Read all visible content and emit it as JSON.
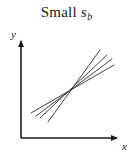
{
  "figure": {
    "title_main": "Small",
    "title_symbol": "s",
    "title_subscript": "b",
    "background_color": "#ffffff",
    "ink_color": "#1a1a1a",
    "line_color": "#2b2b2b",
    "width": 133,
    "height": 154
  },
  "axes": {
    "x_label": "x",
    "y_label": "y",
    "origin": {
      "x": 21,
      "y": 138
    },
    "x_end": {
      "x": 120,
      "y": 138
    },
    "y_end": {
      "x": 21,
      "y": 38
    },
    "arrowheads": true
  },
  "chart_data": {
    "type": "line",
    "xlabel": "x",
    "ylabel": "y",
    "grid": false,
    "legend": null,
    "axis_ticks": [],
    "intersection_point": {
      "x": 69,
      "y": 88
    },
    "series": [
      {
        "name": "line-1-steepest",
        "x": [
          48,
          100
        ],
        "y": [
          122,
          50
        ],
        "slope_sign": "positive"
      },
      {
        "name": "line-2",
        "x": [
          40,
          107
        ],
        "y": [
          118,
          55
        ],
        "slope_sign": "positive"
      },
      {
        "name": "line-3",
        "x": [
          36,
          112
        ],
        "y": [
          116,
          59
        ],
        "slope_sign": "positive"
      },
      {
        "name": "line-4-flattest",
        "x": [
          31,
          114
        ],
        "y": [
          113,
          65
        ],
        "slope_sign": "positive"
      }
    ]
  }
}
